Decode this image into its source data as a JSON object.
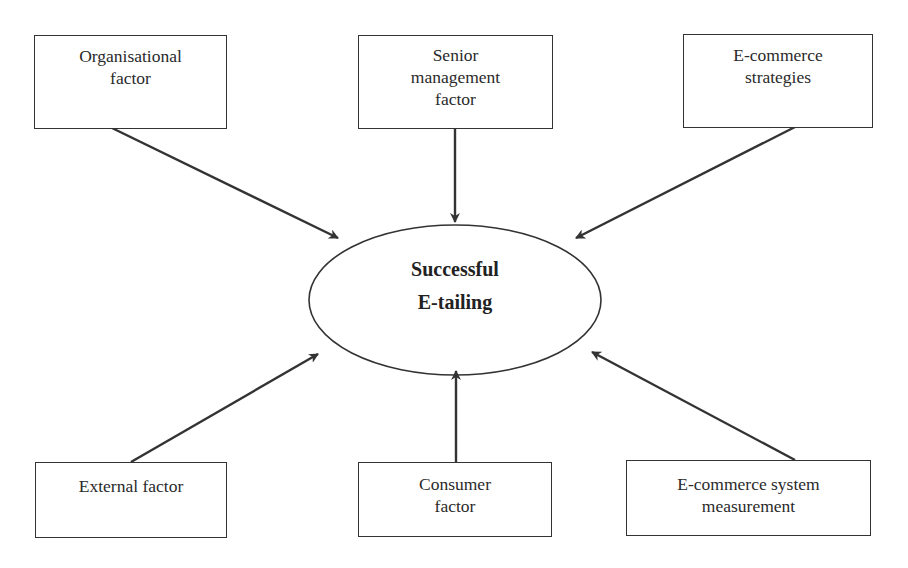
{
  "diagram": {
    "center": {
      "lines": [
        "Successful",
        "E-tailing"
      ]
    },
    "factors": [
      {
        "id": "organisational",
        "lines": [
          "Organisational",
          "factor"
        ]
      },
      {
        "id": "senior-management",
        "lines": [
          "Senior",
          "management",
          "factor"
        ]
      },
      {
        "id": "ecommerce-strategies",
        "lines": [
          "E-commerce",
          "strategies"
        ]
      },
      {
        "id": "external",
        "lines": [
          "External factor"
        ]
      },
      {
        "id": "consumer",
        "lines": [
          "Consumer",
          "factor"
        ]
      },
      {
        "id": "ecommerce-system-measurement",
        "lines": [
          "E-commerce system",
          "measurement"
        ]
      }
    ],
    "edges": [
      {
        "from": "organisational",
        "to": "center"
      },
      {
        "from": "senior-management",
        "to": "center"
      },
      {
        "from": "ecommerce-strategies",
        "to": "center"
      },
      {
        "from": "external",
        "to": "center"
      },
      {
        "from": "consumer",
        "to": "center"
      },
      {
        "from": "ecommerce-system-measurement",
        "to": "center"
      }
    ],
    "colors": {
      "stroke": "#333333",
      "background": "#ffffff",
      "text": "#2a2a2a"
    }
  }
}
